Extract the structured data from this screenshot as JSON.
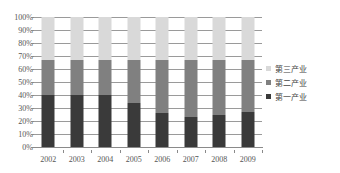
{
  "chart_data": {
    "type": "bar",
    "stacked": true,
    "normalized": "100%",
    "title": "",
    "subtitle": "",
    "xlabel": "",
    "ylabel": "",
    "categories": [
      "2002",
      "2003",
      "2004",
      "2005",
      "2006",
      "2007",
      "2008",
      "2009"
    ],
    "ylim": [
      0,
      100
    ],
    "ytick_labels": [
      "100%",
      "90%",
      "80%",
      "70%",
      "60%",
      "50%",
      "40%",
      "30%",
      "20%",
      "10%",
      "0%"
    ],
    "ytick_values": [
      100,
      90,
      80,
      70,
      60,
      50,
      40,
      30,
      20,
      10,
      0
    ],
    "grid": true,
    "legend_position": "right",
    "series": [
      {
        "name": "第三产业",
        "color": "#d9d9d9",
        "values": [
          33,
          33,
          33,
          33,
          33,
          33,
          33,
          33
        ]
      },
      {
        "name": "第二产业",
        "color": "#808080",
        "values": [
          27,
          27,
          27,
          33,
          41,
          44,
          42,
          40
        ]
      },
      {
        "name": "第一产业",
        "color": "#3a3a3a",
        "values": [
          40,
          40,
          40,
          34,
          26,
          23,
          25,
          27
        ]
      }
    ],
    "legend": [
      {
        "label": "第三产业",
        "color": "#d9d9d9"
      },
      {
        "label": "第二产业",
        "color": "#808080"
      },
      {
        "label": "第一产业",
        "color": "#3a3a3a"
      }
    ]
  },
  "colors": {
    "axis": "#8a8a8a",
    "gridline": "#9a9a9a",
    "label": "#555555",
    "background": "#ffffff"
  }
}
